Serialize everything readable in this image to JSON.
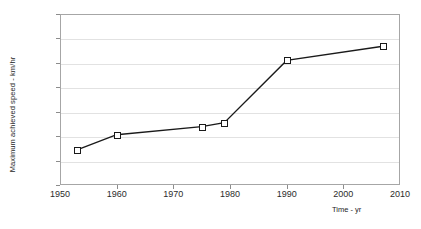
{
  "chart_data": {
    "type": "line",
    "title": "",
    "xlabel": "Time - yr",
    "ylabel": "Maximum achieved speed - km/hr",
    "xlim": [
      1950,
      2010
    ],
    "ylim": [
      0,
      700
    ],
    "xticks": [
      1950,
      1960,
      1970,
      1980,
      1990,
      2000,
      2010
    ],
    "yticks": [
      0,
      100,
      200,
      300,
      400,
      500,
      600,
      700
    ],
    "grid": "horizontal",
    "legend": "none",
    "marker": "open-square",
    "line_color": "#1a1a1a",
    "marker_face_color": "#ffffff",
    "marker_edge_color": "#1a1a1a",
    "grid_color": "#e2e2e2",
    "frame_color": "#a6a6a6",
    "x": [
      1953,
      1960,
      1975,
      1979,
      1990,
      2007
    ],
    "values": [
      144,
      206,
      239,
      255,
      510,
      568
    ],
    "points": [
      {
        "x": 1953,
        "y": 144
      },
      {
        "x": 1960,
        "y": 206
      },
      {
        "x": 1975,
        "y": 239
      },
      {
        "x": 1979,
        "y": 255
      },
      {
        "x": 1990,
        "y": 510
      },
      {
        "x": 2007,
        "y": 568
      }
    ],
    "series": [
      {
        "name": "Maximum achieved speed",
        "x": [
          1953,
          1960,
          1975,
          1979,
          1990,
          2007
        ],
        "values": [
          144,
          206,
          239,
          255,
          510,
          568
        ]
      }
    ]
  }
}
